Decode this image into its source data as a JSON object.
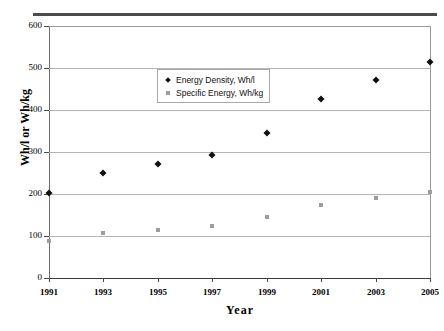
{
  "chart_data": {
    "type": "scatter",
    "title": "",
    "xlabel": "Year",
    "ylabel": "Wh/l or Wh/kg",
    "x": [
      1991,
      1993,
      1995,
      1997,
      1999,
      2001,
      2003,
      2005
    ],
    "xtick_labels": [
      "1991",
      "1993",
      "1995",
      "1997",
      "1999",
      "2001",
      "2003",
      "2005"
    ],
    "ytick_labels": [
      "0",
      "100",
      "200",
      "300",
      "400",
      "500",
      "600"
    ],
    "yticks": [
      0,
      100,
      200,
      300,
      400,
      500,
      600
    ],
    "xlim": [
      1991,
      2005
    ],
    "ylim": [
      0,
      600
    ],
    "grid": "horizontal",
    "legend_position": "upper-center-left",
    "series": [
      {
        "name": "Energy Density, Wh/l",
        "marker": "diamond",
        "color": "#111111",
        "values": [
          203,
          250,
          272,
          294,
          345,
          427,
          472,
          515
        ]
      },
      {
        "name": "Specific Energy, Wh/kg",
        "marker": "square",
        "color": "#9d9d9d",
        "values": [
          88,
          108,
          114,
          123,
          145,
          174,
          191,
          204
        ]
      }
    ]
  },
  "legend": {
    "items": [
      {
        "label": "Energy Density, Wh/l",
        "marker": "diamond"
      },
      {
        "label": "Specific Energy, Wh/kg",
        "marker": "square"
      }
    ]
  },
  "axes": {
    "x_title": "Year",
    "y_title": "Wh/l or Wh/kg"
  }
}
